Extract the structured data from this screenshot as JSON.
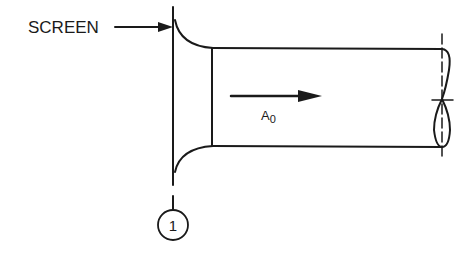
{
  "diagram": {
    "screen_label": "SCREEN",
    "flow_label_main": "A",
    "flow_label_sub": "0",
    "station_number": "1",
    "colors": {
      "ink": "#1a1a1a",
      "background": "#ffffff"
    }
  }
}
